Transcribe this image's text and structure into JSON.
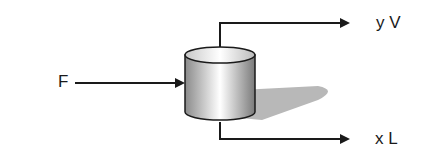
{
  "diagram": {
    "type": "flash-separator",
    "feed": {
      "label": "F"
    },
    "vapor_outlet": {
      "label": "y V"
    },
    "liquid_outlet": {
      "label": "x L"
    },
    "unit": {
      "shape": "cylinder-vessel"
    }
  },
  "colors": {
    "line": "#1a1a1a",
    "shadow": "#b8b8b8"
  }
}
